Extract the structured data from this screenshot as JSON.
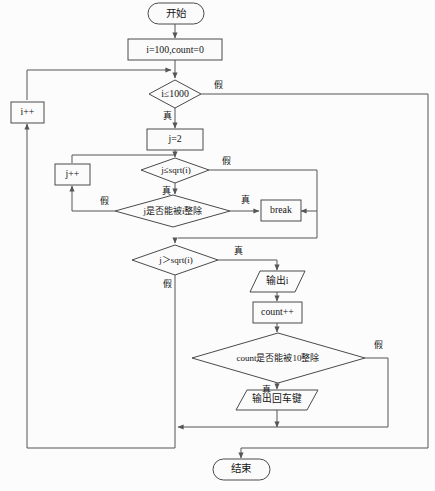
{
  "diagram": {
    "language": "zh-CN",
    "colors": {
      "background": "#fcfcfc",
      "shape_fill": "#fbfbfb",
      "shape_stroke": "#4a4a4a",
      "connector": "#555555",
      "text": "#151515"
    },
    "nodes": {
      "start": {
        "type": "terminator",
        "label": "开始"
      },
      "init": {
        "type": "process",
        "label": "i=100,count=0"
      },
      "cond_i": {
        "type": "decision",
        "label": "i≤1000"
      },
      "i_inc": {
        "type": "process",
        "label": "i++"
      },
      "j_init": {
        "type": "process",
        "label": "j=2"
      },
      "cond_j_le": {
        "type": "decision",
        "label": "j≤sqrt(i)"
      },
      "j_inc": {
        "type": "process",
        "label": "j++"
      },
      "cond_div": {
        "type": "decision",
        "label": "j是否能被i整除"
      },
      "break": {
        "type": "process",
        "label": "break"
      },
      "cond_j_gt": {
        "type": "decision",
        "label": "j＞sqrt(i)"
      },
      "print_i": {
        "type": "io",
        "label": "输出i"
      },
      "count_inc": {
        "type": "process",
        "label": "count++"
      },
      "cond_count": {
        "type": "decision",
        "label": "count是否能被10整除"
      },
      "print_nl": {
        "type": "io",
        "label": "输出回车键"
      },
      "end": {
        "type": "terminator",
        "label": "结束"
      }
    },
    "edge_labels": {
      "cond_i_false": "假",
      "cond_i_true": "真",
      "cond_j_le_false": "假",
      "cond_j_le_true": "真",
      "cond_div_false": "假",
      "cond_div_true": "真",
      "cond_j_gt_true": "真",
      "cond_j_gt_false": "假",
      "cond_count_false": "假",
      "cond_count_true": "真"
    }
  }
}
